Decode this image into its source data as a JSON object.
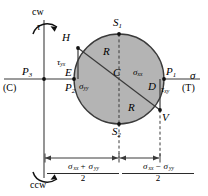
{
  "figure": {
    "type": "mohrs-circle-diagram",
    "title_text": "",
    "axes": {
      "horizontal_axis_label": "σ",
      "vertical_axis_label": "τ",
      "left_end_label": "(C)",
      "right_end_label": "(T)",
      "top_rotation_label": "cw",
      "bottom_rotation_label": "ccw"
    },
    "points": [
      {
        "id": "P3",
        "letter": "P",
        "sub": "3"
      },
      {
        "id": "P2",
        "letter": "P",
        "sub": "2"
      },
      {
        "id": "P1",
        "letter": "P",
        "sub": "1"
      },
      {
        "id": "S1",
        "letter": "S",
        "sub": "1"
      },
      {
        "id": "S2",
        "letter": "S",
        "sub": "2"
      },
      {
        "id": "H",
        "letter": "H",
        "sub": ""
      },
      {
        "id": "V",
        "letter": "V",
        "sub": ""
      },
      {
        "id": "C",
        "letter": "C",
        "sub": ""
      },
      {
        "id": "E",
        "letter": "E",
        "sub": ""
      },
      {
        "id": "D",
        "letter": "D",
        "sub": ""
      }
    ],
    "stress_labels": {
      "tau_yx": {
        "sym": "τ",
        "sub": "yx"
      },
      "tau_xy": {
        "sym": "τ",
        "sub": "xy"
      },
      "sigma_xx": {
        "sym": "σ",
        "sub": "xx"
      },
      "sigma_yy": {
        "sym": "σ",
        "sub": "yy"
      },
      "radius_upper": "R",
      "radius_lower": "R"
    },
    "dimensions": [
      {
        "id": "mean-stress",
        "num_sym1": "σ",
        "num_sub1": "xx",
        "op": "+",
        "num_sym2": "σ",
        "num_sub2": "yy",
        "den": "2"
      },
      {
        "id": "radius-expression",
        "num_sym1": "σ",
        "num_sub1": "xx",
        "op": "−",
        "num_sym2": "σ",
        "num_sub2": "yy",
        "den": "2"
      }
    ],
    "colors": {
      "circle_fill": "#b3b3b3",
      "stroke": "#2b2b2b",
      "axis": "#6e6e6e",
      "text": "#000000",
      "background": "#ffffff"
    }
  }
}
